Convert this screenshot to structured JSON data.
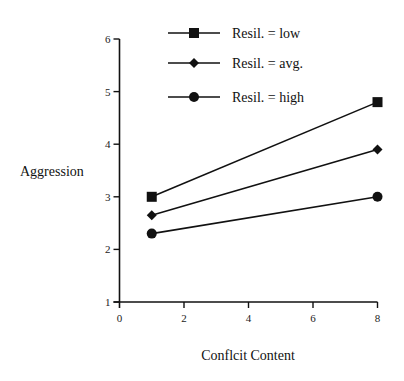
{
  "chart_data": {
    "type": "line",
    "title": "",
    "xlabel": "Conflcit Content",
    "ylabel": "Aggression",
    "xlim": [
      0,
      8
    ],
    "ylim": [
      1,
      6
    ],
    "x_ticks": [
      0,
      2,
      4,
      6,
      8
    ],
    "y_ticks": [
      1,
      2,
      3,
      4,
      5,
      6
    ],
    "grid": false,
    "legend_position": "top",
    "x": [
      1,
      8
    ],
    "series": [
      {
        "name": "Resil. = low",
        "marker": "square",
        "values": [
          3.0,
          4.8
        ]
      },
      {
        "name": "Resil. = avg.",
        "marker": "diamond",
        "values": [
          2.65,
          3.9
        ]
      },
      {
        "name": "Resil.  = high",
        "marker": "circle",
        "values": [
          2.3,
          3.0
        ]
      }
    ]
  },
  "colors": {
    "line": "#111111",
    "axis": "#111111",
    "background": "#ffffff"
  }
}
